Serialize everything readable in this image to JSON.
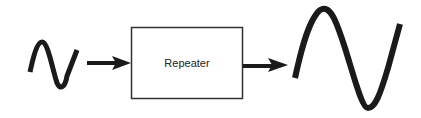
{
  "diagram": {
    "input_signal": {
      "label": "",
      "shape": "weak-sine-wave"
    },
    "block": {
      "label": "Repeater"
    },
    "output_signal": {
      "label": "",
      "shape": "amplified-sine-wave"
    },
    "colors": {
      "stroke": "#1a1a1a",
      "box_border": "#333333",
      "background": "#ffffff",
      "text": "#222222"
    }
  }
}
